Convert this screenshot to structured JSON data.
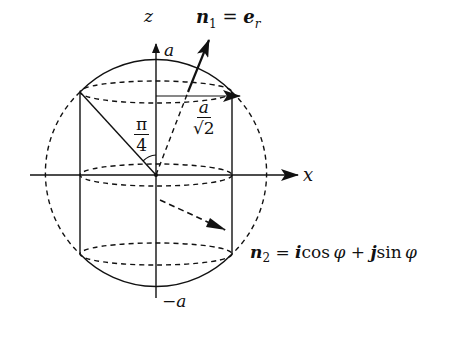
{
  "diagram": {
    "axes": {
      "z_label": "z",
      "x_label": "x",
      "top_label": "a",
      "bottom_label": "−a"
    },
    "angle_label": {
      "num": "π",
      "den": "4"
    },
    "radius_label": {
      "num": "a",
      "den": "√2"
    },
    "n1": {
      "sym": "n",
      "sub": "1",
      "rhs_sym": "e",
      "rhs_sub": "r",
      "eq": "="
    },
    "n2": {
      "sym": "n",
      "sub": "2",
      "eq": "=",
      "i": "i",
      "cos": "cos",
      "phi": "φ",
      "plus": "+",
      "j": "j",
      "sin": "sin"
    },
    "colors": {
      "ink": "#111111",
      "background": "#ffffff"
    }
  }
}
